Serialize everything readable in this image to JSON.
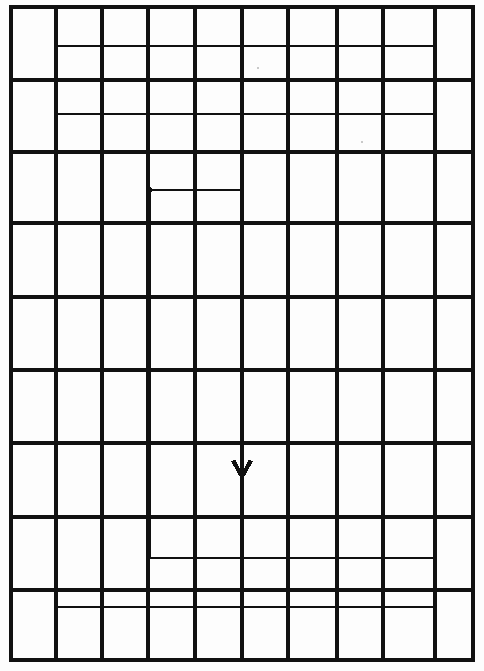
{
  "figure": {
    "type": "line-diagram",
    "background_color": "#fdfdfd",
    "canvas": {
      "width": 484,
      "height": 671
    }
  },
  "grid": {
    "name": "ruled-grid",
    "stroke_color": "#111111",
    "stroke_width": 3.2,
    "columns": 10,
    "rows": 9,
    "x_lines": [
      11,
      56,
      102,
      148,
      195,
      242,
      288,
      337,
      383,
      435,
      473
    ],
    "y_lines": [
      7,
      80,
      152,
      223,
      297,
      370,
      443,
      517,
      590,
      660
    ],
    "left": 11,
    "right": 473,
    "top": 7,
    "bottom": 660,
    "border_stroke_width": 4.0
  },
  "spiral": {
    "name": "spiral-path",
    "stroke_color": "#111111",
    "stroke_width": 1.6,
    "turns": 3,
    "direction": "clockwise-inward",
    "start_point": {
      "x": 55,
      "y": 46
    },
    "end_point": {
      "x": 242,
      "y": 480
    },
    "vertices": [
      [
        55,
        46
      ],
      [
        435,
        46
      ],
      [
        435,
        114
      ],
      [
        55,
        114
      ],
      [
        55,
        607
      ],
      [
        435,
        607
      ],
      [
        435,
        558
      ],
      [
        150,
        558
      ],
      [
        150,
        190
      ],
      [
        242,
        190
      ],
      [
        242,
        480
      ]
    ],
    "path_d": "M 55 46 L 435 46 L 435 114 L 55 114 L 55 607 L 435 607 L 435 558 L 150 558 L 150 190 L 242 190 L 242 480"
  },
  "marker_dot": {
    "name": "spiral-inner-node",
    "x": 150,
    "y": 190,
    "radius": 2.6,
    "color": "#111111"
  },
  "arrow": {
    "name": "direction-arrow",
    "shape": "chevron-down",
    "tip": {
      "x": 242,
      "y": 481
    },
    "half_width": 11,
    "height": 20,
    "color": "#111111"
  },
  "speck_marks": [
    {
      "x": 258,
      "y": 68,
      "r": 0.8
    },
    {
      "x": 362,
      "y": 142,
      "r": 0.8
    }
  ]
}
